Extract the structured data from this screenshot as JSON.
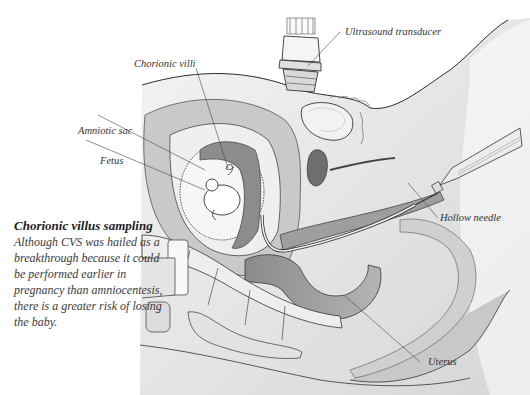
{
  "diagram": {
    "labels": {
      "ultrasound_transducer": "Ultrasound transducer",
      "chorionic_villi": "Chorionic villi",
      "amniotic_sac": "Amniotic sac",
      "fetus": "Fetus",
      "hollow_needle": "Hollow needle",
      "uterus": "Uterus"
    },
    "caption": {
      "title": "Chorionic villus sampling",
      "body": "Although CVS was hailed as a breakthrough because it could be performed earlier in pregnancy than amniocentesis, there is a greater risk of losing the baby."
    },
    "colors": {
      "line": "#2b2b2b",
      "tissue_light": "#e6e6e6",
      "tissue_mid": "#bdbdbd",
      "tissue_dark": "#7a7a7a",
      "label_text": "#333333"
    }
  }
}
